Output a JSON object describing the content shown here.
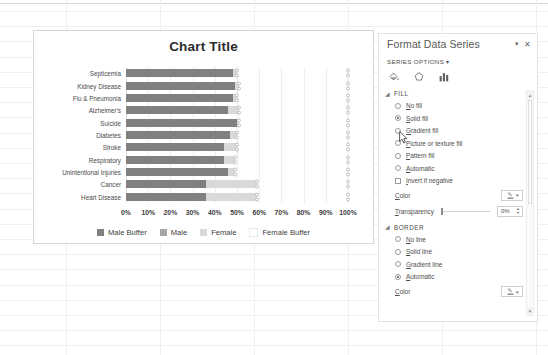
{
  "chart": {
    "title": "Chart Title",
    "legend": [
      {
        "label": "Male Buffer",
        "color": "#808080"
      },
      {
        "label": "Male",
        "color": "#a6a6a6"
      },
      {
        "label": "Female",
        "color": "#d9d9d9"
      },
      {
        "label": "Female Buffer",
        "color": "#ffffff"
      }
    ]
  },
  "chart_data": {
    "type": "bar",
    "orientation": "horizontal",
    "stacked": true,
    "title": "Chart Title",
    "xlabel": "",
    "ylabel": "",
    "xlim": [
      0,
      100
    ],
    "xticks": [
      "0%",
      "10%",
      "20%",
      "30%",
      "40%",
      "50%",
      "60%",
      "70%",
      "80%",
      "90%",
      "100%"
    ],
    "grid": true,
    "legend_position": "bottom",
    "categories": [
      "Septicemia",
      "Kidney Disease",
      "Flu & Pneumonia",
      "Alzheimer's",
      "Suicide",
      "Diabetes",
      "Stroke",
      "Respiratory",
      "Unintentional Injuries",
      "Cancer",
      "Heart Disease"
    ],
    "series": [
      {
        "name": "Male Buffer",
        "color": "#808080",
        "values": [
          48,
          49,
          48,
          46,
          50,
          47,
          44,
          44,
          46,
          36,
          36
        ]
      },
      {
        "name": "Male",
        "color": "#a6a6a6",
        "values": [
          0,
          0,
          0,
          0,
          0,
          0,
          0,
          0,
          0,
          0,
          0
        ]
      },
      {
        "name": "Female",
        "color": "#d9d9d9",
        "values": [
          2,
          2,
          2,
          5,
          1,
          3,
          6,
          5,
          3,
          23,
          23
        ]
      },
      {
        "name": "Female Buffer",
        "color": "#ffffff",
        "values": [
          50,
          49,
          50,
          49,
          49,
          50,
          50,
          51,
          51,
          41,
          41
        ]
      }
    ]
  },
  "pane": {
    "title": "Format Data Series",
    "dropdown_icon": "chevron-down-icon",
    "close_icon": "close-icon",
    "series_options": "SERIES OPTIONS",
    "tabs": [
      {
        "name": "fill-and-line-tab",
        "icon": "paint-bucket-icon"
      },
      {
        "name": "effects-tab",
        "icon": "pentagon-effects-icon"
      },
      {
        "name": "series-options-tab",
        "icon": "bar-chart-icon"
      }
    ],
    "fill": {
      "heading": "FILL",
      "expanded": true,
      "options": [
        {
          "label": "No fill",
          "selected": false
        },
        {
          "label": "Solid fill",
          "selected": true
        },
        {
          "label": "Gradient fill",
          "selected": false
        },
        {
          "label": "Picture or texture fill",
          "selected": false
        },
        {
          "label": "Pattern fill",
          "selected": false
        },
        {
          "label": "Automatic",
          "selected": false
        }
      ],
      "invert_if_negative": {
        "label": "Invert if negative",
        "checked": false
      },
      "color_label": "Color",
      "transparency_label": "Transparency",
      "transparency_value": "0%"
    },
    "border": {
      "heading": "BORDER",
      "expanded": true,
      "options": [
        {
          "label": "No line",
          "selected": false
        },
        {
          "label": "Solid line",
          "selected": false
        },
        {
          "label": "Gradient line",
          "selected": false
        },
        {
          "label": "Automatic",
          "selected": true
        }
      ],
      "color_label": "Color"
    },
    "scrollbar": {
      "up": "▲",
      "down": "▼"
    }
  }
}
